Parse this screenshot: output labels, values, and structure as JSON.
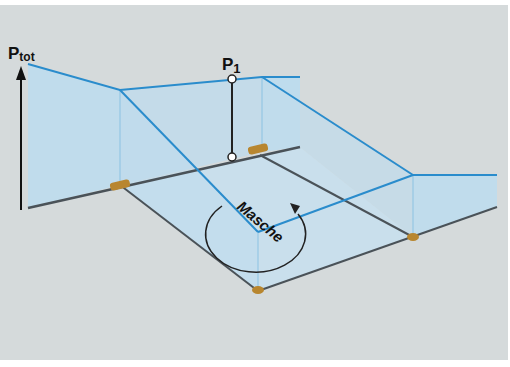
{
  "diagram": {
    "type": "3D isometric illustration of a mesh (Masche) in a pipe network with pressure levels",
    "labels": {
      "axis_label_main": "P",
      "axis_label_sub": "tot",
      "point_label_main": "P",
      "point_label_sub": "1",
      "loop_label": "Masche"
    },
    "colors": {
      "background": "#d5dadb",
      "pressure_line": "#2a8ccc",
      "wall_fill": "#bcdcef",
      "floor_fill": "#c7dfee",
      "pipe": "#4a5258",
      "fitting": "#b8862f",
      "axis": "#111111"
    }
  }
}
